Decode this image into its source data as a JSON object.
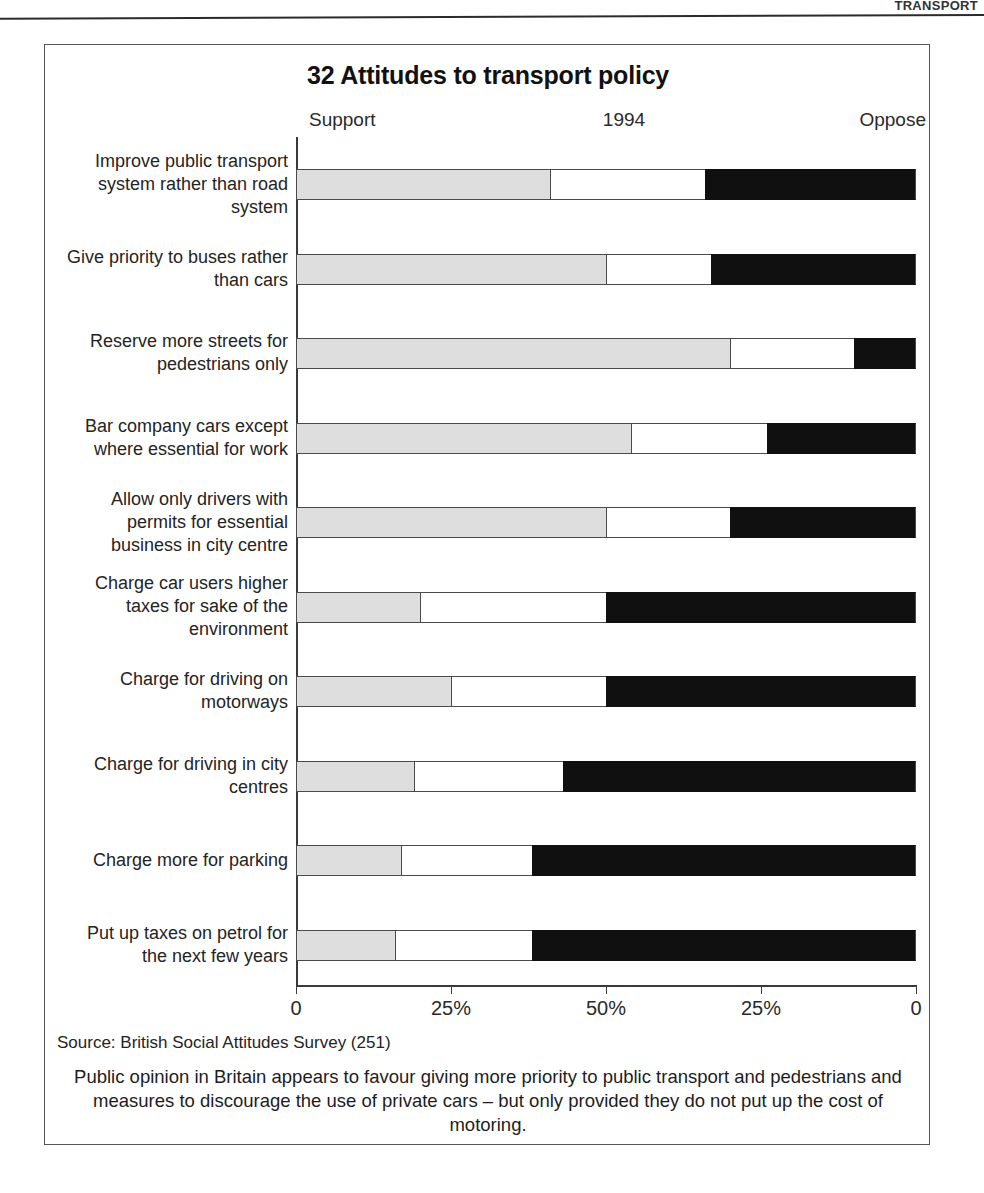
{
  "page": {
    "header_sliver": "TRANSPORT"
  },
  "figure": {
    "title": "32 Attitudes to transport policy",
    "header": {
      "left": "Support",
      "center": "1994",
      "right": "Oppose"
    },
    "source": "Source: British Social Attitudes Survey (251)",
    "caption": "Public opinion in Britain appears to favour giving more priority to public transport and pedestrians and measures to discourage the use of private cars – but only provided they do not put up the cost of motoring.",
    "axis": {
      "ticks": [
        "0",
        "25%",
        "50%",
        "25%",
        "0"
      ],
      "tick_positions_pct": [
        0,
        25,
        50,
        75,
        100
      ]
    },
    "colors": {
      "support": "#dedede",
      "neither": "#ffffff",
      "oppose": "#101010",
      "outline": "#4a4a4a",
      "frame": "#555555"
    }
  },
  "chart_data": {
    "type": "bar",
    "orientation": "horizontal",
    "stacked": true,
    "title": "32 Attitudes to transport policy",
    "subtitle": "1994",
    "xlabel": "",
    "ylabel": "",
    "xlim": [
      0,
      100
    ],
    "grid": false,
    "legend_position": "top",
    "tick_labels": [
      "0",
      "25%",
      "50%",
      "25%",
      "0"
    ],
    "categories": [
      "Improve public transport system rather than road system",
      "Give priority to buses rather than cars",
      "Reserve more streets for pedestrians only",
      "Bar company cars except where essential for work",
      "Allow only drivers with permits for essential business in city centre",
      "Charge car users higher taxes for sake of the environment",
      "Charge for driving on motorways",
      "Charge for driving in city centres",
      "Charge more for parking",
      "Put up taxes on petrol for the next few years"
    ],
    "series": [
      {
        "name": "Support",
        "values": [
          41,
          50,
          70,
          54,
          50,
          20,
          25,
          19,
          17,
          16
        ]
      },
      {
        "name": "Neither",
        "values": [
          25,
          17,
          20,
          22,
          20,
          30,
          25,
          24,
          21,
          22
        ]
      },
      {
        "name": "Oppose",
        "values": [
          34,
          33,
          10,
          24,
          30,
          50,
          50,
          57,
          62,
          62
        ]
      }
    ]
  },
  "rows": [
    {
      "label": "Improve public transport system rather than road system",
      "support": 41,
      "neither": 25,
      "oppose": 34
    },
    {
      "label": "Give priority to buses rather than cars",
      "support": 50,
      "neither": 17,
      "oppose": 33
    },
    {
      "label": "Reserve more streets for pedestrians only",
      "support": 70,
      "neither": 20,
      "oppose": 10
    },
    {
      "label": "Bar company cars except where essential for work",
      "support": 54,
      "neither": 22,
      "oppose": 24
    },
    {
      "label": "Allow only drivers with permits for essential business in city centre",
      "support": 50,
      "neither": 20,
      "oppose": 30
    },
    {
      "label": "Charge car users higher taxes for sake of the environment",
      "support": 20,
      "neither": 30,
      "oppose": 50
    },
    {
      "label": "Charge for driving on motorways",
      "support": 25,
      "neither": 25,
      "oppose": 50
    },
    {
      "label": "Charge for driving in city centres",
      "support": 19,
      "neither": 24,
      "oppose": 57
    },
    {
      "label": "Charge more for parking",
      "support": 17,
      "neither": 21,
      "oppose": 62
    },
    {
      "label": "Put up taxes on petrol for the next few years",
      "support": 16,
      "neither": 22,
      "oppose": 62
    }
  ]
}
